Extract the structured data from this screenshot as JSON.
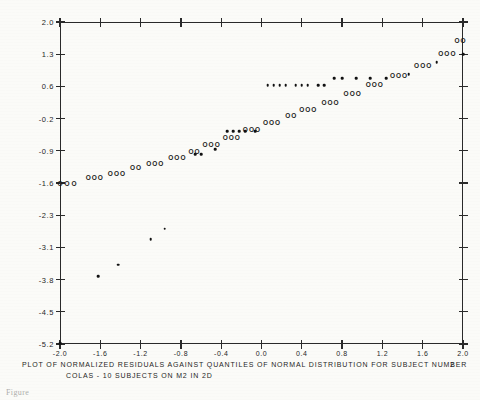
{
  "figure": {
    "caption_line1": "PLOT OF NORMALIZED RESIDUALS AGAINST QUANTILES OF NORMAL DISTRIBUTION FOR SUBJECT NUMBER",
    "caption_subject_number": "2",
    "caption_line2": "COLAS - 10 SUBJECTS ON M2 IN 2D",
    "bottom_note": "Figure",
    "ink_color": "#1a1a1a",
    "paper_color": "#fbfbf8"
  },
  "chart_data": {
    "type": "scatter",
    "subtitle": "COLAS - 10 SUBJECTS ON M2 IN 2D",
    "xlabel": "",
    "ylabel": "",
    "grid": false,
    "legend": "none",
    "xlim": [
      -2.0,
      2.0
    ],
    "ylim": [
      -5.2,
      2.0
    ],
    "xticks": [
      -2.0,
      -1.6,
      -1.2,
      -0.8,
      -0.4,
      0.0,
      0.4,
      0.8,
      1.2,
      1.6,
      2.0
    ],
    "xticklabels": [
      "-2.0",
      "-1.6",
      "-1.2",
      "-0.8",
      "-0.4",
      "0.0",
      "0.4",
      "0.8",
      "1.2",
      "1.6",
      "2.0"
    ],
    "yticks": [
      2.0,
      1.3,
      0.6,
      -0.2,
      -0.9,
      -1.6,
      -2.3,
      -3.1,
      -3.8,
      -4.5,
      -5.2
    ],
    "yticklabels": [
      "2.0",
      "1.3",
      "0.6",
      "-0.2",
      "-0.9",
      "-1.6",
      "-2.3",
      "-3.1",
      "-3.8",
      "-4.5",
      "-5.2"
    ],
    "series": [
      {
        "name": "O",
        "marker": "open-circle",
        "points": [
          [
            -2.0,
            -1.62
          ],
          [
            -1.93,
            -1.62
          ],
          [
            -1.86,
            -1.62
          ],
          [
            -1.72,
            -1.5
          ],
          [
            -1.66,
            -1.5
          ],
          [
            -1.6,
            -1.5
          ],
          [
            -1.5,
            -1.4
          ],
          [
            -1.44,
            -1.4
          ],
          [
            -1.38,
            -1.4
          ],
          [
            -1.28,
            -1.28
          ],
          [
            -1.22,
            -1.28
          ],
          [
            -1.12,
            -1.18
          ],
          [
            -1.06,
            -1.18
          ],
          [
            -1.0,
            -1.18
          ],
          [
            -0.9,
            -1.05
          ],
          [
            -0.84,
            -1.05
          ],
          [
            -0.78,
            -1.05
          ],
          [
            -0.7,
            -0.92
          ],
          [
            -0.64,
            -0.92
          ],
          [
            -0.56,
            -0.78
          ],
          [
            -0.5,
            -0.78
          ],
          [
            -0.44,
            -0.78
          ],
          [
            -0.36,
            -0.62
          ],
          [
            -0.3,
            -0.62
          ],
          [
            -0.24,
            -0.62
          ],
          [
            -0.16,
            -0.45
          ],
          [
            -0.1,
            -0.45
          ],
          [
            -0.04,
            -0.45
          ],
          [
            0.04,
            -0.3
          ],
          [
            0.1,
            -0.3
          ],
          [
            0.16,
            -0.3
          ],
          [
            0.26,
            -0.14
          ],
          [
            0.32,
            -0.14
          ],
          [
            0.4,
            0.02
          ],
          [
            0.46,
            0.02
          ],
          [
            0.52,
            0.02
          ],
          [
            0.62,
            0.2
          ],
          [
            0.68,
            0.2
          ],
          [
            0.74,
            0.2
          ],
          [
            0.84,
            0.4
          ],
          [
            0.9,
            0.4
          ],
          [
            0.96,
            0.4
          ],
          [
            1.06,
            0.62
          ],
          [
            1.12,
            0.62
          ],
          [
            1.18,
            0.62
          ],
          [
            1.3,
            0.82
          ],
          [
            1.36,
            0.82
          ],
          [
            1.42,
            0.82
          ],
          [
            1.54,
            1.05
          ],
          [
            1.6,
            1.05
          ],
          [
            1.66,
            1.05
          ],
          [
            1.78,
            1.3
          ],
          [
            1.84,
            1.3
          ],
          [
            1.9,
            1.3
          ],
          [
            1.94,
            1.58
          ],
          [
            2.0,
            1.58
          ]
        ]
      },
      {
        "name": "dot",
        "marker": "filled-dot",
        "points": [
          [
            -2.0,
            -5.18
          ],
          [
            -1.62,
            -3.72
          ],
          [
            -1.42,
            -3.48
          ],
          [
            -1.1,
            -2.9
          ],
          [
            -0.96,
            -2.64
          ],
          [
            -0.66,
            -0.98
          ],
          [
            -0.6,
            -0.98
          ],
          [
            -0.46,
            -0.86
          ],
          [
            -0.34,
            -0.48
          ],
          [
            -0.28,
            -0.48
          ],
          [
            -0.22,
            -0.48
          ],
          [
            -0.16,
            -0.48
          ],
          [
            -0.06,
            -0.48
          ],
          [
            0.06,
            0.62
          ],
          [
            0.12,
            0.62
          ],
          [
            0.18,
            0.62
          ],
          [
            0.24,
            0.62
          ],
          [
            0.34,
            0.62
          ],
          [
            0.4,
            0.62
          ],
          [
            0.46,
            0.62
          ],
          [
            0.56,
            0.62
          ],
          [
            0.62,
            0.62
          ],
          [
            0.72,
            0.78
          ],
          [
            0.8,
            0.78
          ],
          [
            0.94,
            0.78
          ],
          [
            1.08,
            0.78
          ],
          [
            1.24,
            0.78
          ],
          [
            1.46,
            0.86
          ],
          [
            1.74,
            1.12
          ],
          [
            2.0,
            1.3
          ]
        ]
      }
    ]
  }
}
